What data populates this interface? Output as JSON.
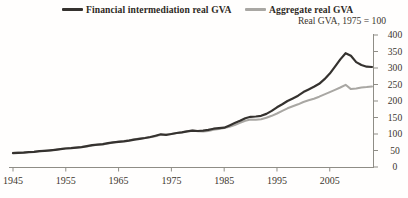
{
  "chart": {
    "subtitle": "Real GVA, 1975 = 100",
    "legend": [
      {
        "label": "Financial intermediation real GVA",
        "color": "#35322f"
      },
      {
        "label": "Aggregate real GVA",
        "color": "#a9a7a3"
      }
    ]
  },
  "chart_data": {
    "type": "line",
    "title": "",
    "subtitle": "Real GVA, 1975 = 100",
    "xlabel": "",
    "ylabel": "Real GVA index (1975 = 100)",
    "xlim": [
      1945,
      2013
    ],
    "ylim": [
      0,
      400
    ],
    "x_ticks": [
      1945,
      1955,
      1965,
      1975,
      1985,
      1995,
      2005
    ],
    "y_ticks": [
      0,
      50,
      100,
      150,
      200,
      250,
      300,
      350,
      400
    ],
    "y_axis_side": "right",
    "grid": false,
    "legend_position": "top",
    "axis_color": "#8f8d86",
    "tick_label_color": "#3c362e",
    "x": [
      1945,
      1946,
      1947,
      1948,
      1949,
      1950,
      1951,
      1952,
      1953,
      1954,
      1955,
      1956,
      1957,
      1958,
      1959,
      1960,
      1961,
      1962,
      1963,
      1964,
      1965,
      1966,
      1967,
      1968,
      1969,
      1970,
      1971,
      1972,
      1973,
      1974,
      1975,
      1976,
      1977,
      1978,
      1979,
      1980,
      1981,
      1982,
      1983,
      1984,
      1985,
      1986,
      1987,
      1988,
      1989,
      1990,
      1991,
      1992,
      1993,
      1994,
      1995,
      1996,
      1997,
      1998,
      1999,
      2000,
      2001,
      2002,
      2003,
      2004,
      2005,
      2006,
      2007,
      2008,
      2009,
      2010,
      2011,
      2012,
      2013
    ],
    "series": [
      {
        "name": "Financial intermediation real GVA",
        "color": "#35322f",
        "stroke_width": 2.2,
        "values": [
          42,
          43,
          43.5,
          45,
          46,
          48,
          49,
          50.5,
          52,
          54,
          56,
          57,
          58.5,
          60,
          63,
          66,
          68,
          69,
          72,
          75,
          76.5,
          78,
          80,
          83,
          85.5,
          88,
          91,
          95,
          99,
          97,
          100,
          103,
          105,
          108,
          110,
          109,
          110,
          112.5,
          116,
          118,
          119,
          126,
          133,
          140,
          148,
          152,
          153,
          155,
          161,
          170,
          181,
          190,
          200,
          208,
          216,
          227,
          235,
          243,
          252,
          266,
          283,
          304,
          326,
          345,
          337,
          318,
          309,
          304,
          303
        ]
      },
      {
        "name": "Aggregate real GVA",
        "color": "#a9a7a3",
        "stroke_width": 2,
        "values": [
          43,
          44,
          43.5,
          45.5,
          46.5,
          48,
          49.5,
          50,
          52.5,
          54.5,
          57,
          58,
          59.5,
          60.5,
          62.5,
          65.5,
          67.5,
          68.5,
          71,
          74.5,
          77,
          79,
          81,
          84,
          86,
          88,
          90,
          93,
          97.5,
          99,
          100,
          103,
          105.5,
          108.5,
          111,
          108.5,
          107.5,
          109.5,
          113,
          115.5,
          118,
          122,
          127,
          134,
          140,
          144,
          143,
          145,
          149,
          155,
          162,
          170,
          178,
          184,
          190,
          197,
          202,
          207,
          213,
          220,
          227,
          234,
          241,
          249,
          236,
          238,
          241,
          242,
          244
        ]
      }
    ]
  }
}
